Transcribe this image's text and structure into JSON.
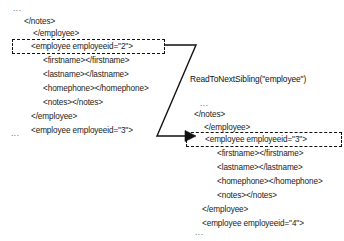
{
  "diagram": {
    "operation_label": "ReadToNextSibling(\"employee\")",
    "ink_color": "#111111",
    "background_color": "#ffffff"
  },
  "before": {
    "top_ellipsis": "...",
    "bottom_ellipsis": "...",
    "lines": [
      {
        "text": "</notes>",
        "indent": 1
      },
      {
        "text": "</employee>",
        "indent": 2
      },
      {
        "text": "<employee employeeid=\"2\">",
        "indent": 3
      },
      {
        "text": "<firstname></firstname>",
        "indent": 4
      },
      {
        "text": "<lastname></lastname>",
        "indent": 4
      },
      {
        "text": "<homephone></homephone>",
        "indent": 4
      },
      {
        "text": "<notes></notes>",
        "indent": 4
      },
      {
        "text": "</employee>",
        "indent": 2
      },
      {
        "text": "<employee employeeid=\"3\">",
        "indent": 2
      }
    ],
    "highlighted_line_index": 2
  },
  "after": {
    "top_ellipsis": "...",
    "bottom_ellipsis": "...",
    "lines": [
      {
        "text": "</notes>",
        "indent": 1
      },
      {
        "text": "</employee>",
        "indent": 2
      },
      {
        "text": "<employee employeeid=\"3\">",
        "indent": 3
      },
      {
        "text": "<firstname></firstname>",
        "indent": 4
      },
      {
        "text": "<lastname></lastname>",
        "indent": 4
      },
      {
        "text": "<homephone></homephone>",
        "indent": 4
      },
      {
        "text": "<notes></notes>",
        "indent": 4
      },
      {
        "text": "</employee>",
        "indent": 2
      },
      {
        "text": "<employee employeeid=\"4\">",
        "indent": 2
      }
    ],
    "highlighted_line_index": 2
  }
}
